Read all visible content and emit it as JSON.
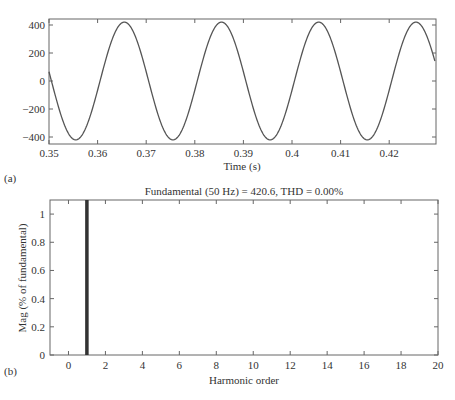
{
  "chart_data": [
    {
      "type": "line",
      "panel_label": "(a)",
      "title": "",
      "xlabel": "Time (s)",
      "ylabel": "",
      "xlim": [
        0.35,
        0.4295
      ],
      "ylim": [
        -440,
        440
      ],
      "xticks": [
        0.35,
        0.36,
        0.37,
        0.38,
        0.39,
        0.4,
        0.41,
        0.42
      ],
      "xtick_labels": [
        "0.35",
        "0.36",
        "0.37",
        "0.38",
        "0.39",
        "0.4",
        "0.41",
        "0.42"
      ],
      "yticks": [
        400,
        200,
        0,
        -200,
        -400
      ],
      "ytick_labels": [
        "400",
        "200",
        "0",
        "−200",
        "−400"
      ],
      "grid": false,
      "series": [
        {
          "name": "signal",
          "description": "50 Hz sinusoid, amplitude 420.6",
          "frequency_hz": 50,
          "amplitude": 420.6,
          "x": [
            0.35,
            0.3525,
            0.355,
            0.3555,
            0.3575,
            0.36,
            0.3625,
            0.365,
            0.3655,
            0.3675,
            0.37,
            0.3725,
            0.375,
            0.3755,
            0.38,
            0.385,
            0.3855,
            0.39,
            0.395,
            0.3955,
            0.4,
            0.405,
            0.4055,
            0.41,
            0.415,
            0.4155,
            0.42,
            0.425,
            0.4255,
            0.4295
          ],
          "y": [
            100,
            -285,
            -419,
            -420.6,
            -340,
            -100,
            285,
            419,
            420.6,
            340,
            100,
            -285,
            -419,
            -420.6,
            -100,
            419,
            420.6,
            100,
            -419,
            -420.6,
            100,
            419,
            420.6,
            100,
            -419,
            -420.6,
            100,
            419,
            420.6,
            100
          ]
        }
      ]
    },
    {
      "type": "bar",
      "panel_label": "(b)",
      "title": "Fundamental (50 Hz) = 420.6, THD = 0.00%",
      "xlabel": "Harmonic order",
      "ylabel": "Mag (% of fundamental)",
      "xlim": [
        -1,
        20
      ],
      "ylim": [
        0,
        1.1
      ],
      "xticks": [
        0,
        2,
        4,
        6,
        8,
        10,
        12,
        14,
        16,
        18,
        20
      ],
      "xtick_labels": [
        "0",
        "2",
        "4",
        "6",
        "8",
        "10",
        "12",
        "14",
        "16",
        "18",
        "20"
      ],
      "yticks": [
        0,
        0.2,
        0.4,
        0.6,
        0.8,
        1
      ],
      "ytick_labels": [
        "0",
        "0.2",
        "0.4",
        "0.6",
        "0.8",
        "1"
      ],
      "grid": false,
      "categories": [
        0,
        1,
        2,
        3,
        4,
        5,
        6,
        7,
        8,
        9,
        10,
        11,
        12,
        13,
        14,
        15,
        16,
        17,
        18,
        19,
        20
      ],
      "values": [
        0,
        100,
        0,
        0,
        0,
        0,
        0,
        0,
        0,
        0,
        0,
        0,
        0,
        0,
        0,
        0,
        0,
        0,
        0,
        0,
        0
      ],
      "note": "Fundamental bar at order 1 extends beyond top of axis (clipped)"
    }
  ],
  "panels": {
    "a": {
      "label": "(a)",
      "xlabel": "Time (s)",
      "xticks": [
        "0.35",
        "0.36",
        "0.37",
        "0.38",
        "0.39",
        "0.4",
        "0.41",
        "0.42"
      ],
      "yticks": [
        "400",
        "200",
        "0",
        "−200",
        "−400"
      ]
    },
    "b": {
      "label": "(b)",
      "title": "Fundamental (50 Hz) = 420.6, THD = 0.00%",
      "xlabel": "Harmonic order",
      "ylabel": "Mag (% of fundamental)",
      "xticks": [
        "0",
        "2",
        "4",
        "6",
        "8",
        "10",
        "12",
        "14",
        "16",
        "18",
        "20"
      ],
      "yticks": [
        "1",
        "0.8",
        "0.6",
        "0.4",
        "0.2",
        "0"
      ]
    }
  },
  "colors": {
    "axis": "#555555",
    "line": "#555555",
    "bar": "#333333",
    "text": "#333333"
  }
}
